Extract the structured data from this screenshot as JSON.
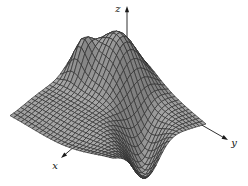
{
  "figure": {
    "background": "#ffffff"
  },
  "chart_data": {
    "type": "surface",
    "title": "",
    "axis_labels": {
      "x": "x",
      "y": "y",
      "z": "z"
    },
    "grid": {
      "rows": 28,
      "cols": 28,
      "s_range": [
        0,
        1
      ],
      "t_range": [
        0,
        1
      ]
    },
    "height_scale_px": 50,
    "surface_components": [
      {
        "kind": "gaussian",
        "amplitude": 1.0,
        "center": [
          0.23,
          0.33
        ],
        "sigma": [
          0.14,
          0.18
        ],
        "rotate_deg": 0
      },
      {
        "kind": "gaussian",
        "amplitude": 0.55,
        "center": [
          0.4,
          0.12
        ],
        "sigma": [
          0.07,
          0.07
        ],
        "rotate_deg": 0
      },
      {
        "kind": "gaussian",
        "amplitude": -0.85,
        "center": [
          0.55,
          0.88
        ],
        "sigma": [
          0.26,
          0.1
        ],
        "rotate_deg": 45
      },
      {
        "kind": "gaussian",
        "amplitude": -0.25,
        "center": [
          1.0,
          0.55
        ],
        "sigma": [
          0.15,
          0.35
        ],
        "rotate_deg": 0
      }
    ],
    "projection_corners": {
      "back": [
        110,
        44
      ],
      "left": [
        10,
        112
      ],
      "front": [
        113,
        152
      ],
      "right": [
        206,
        124
      ]
    },
    "axes_screen": {
      "z": {
        "from": [
          127,
          58
        ],
        "to": [
          127,
          6
        ],
        "label_pos": [
          118,
          12
        ]
      },
      "x": {
        "from": [
          96,
          128
        ],
        "to": [
          61,
          158
        ],
        "label_pos": [
          55,
          169
        ]
      },
      "y": {
        "from": [
          186,
          116
        ],
        "to": [
          228,
          140
        ],
        "label_pos": [
          234,
          146
        ]
      }
    },
    "style": {
      "background": "#ffffff",
      "surface_fill": "#a2a2a2",
      "mesh_line": "#2f2f2f",
      "axis_color": "#1a1a1a",
      "label_color": "#111111",
      "shade_min": "#808080",
      "shade_max": "#bababa"
    },
    "canvas": {
      "width": 248,
      "height": 186
    }
  }
}
